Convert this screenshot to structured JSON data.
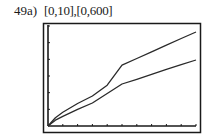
{
  "problem_label": "49a)",
  "window_label": "[0,10],[0,600]",
  "chart_data": {
    "type": "line",
    "title": "[0,10],[0,600]",
    "xlabel": "",
    "ylabel": "",
    "xlim": [
      0,
      10
    ],
    "ylim": [
      0,
      600
    ],
    "x_ticks": [
      0,
      1,
      2,
      3,
      4,
      5,
      6,
      7,
      8,
      9,
      10
    ],
    "y_ticks": [
      0,
      100,
      200,
      300,
      400,
      500,
      600
    ],
    "grid": false,
    "legend": null,
    "x": [
      0,
      0.5,
      1,
      2,
      3,
      4,
      5,
      6,
      7,
      8,
      9,
      10
    ],
    "series": [
      {
        "name": "upper curve",
        "values": [
          0,
          50,
          82,
          135,
          180,
          245,
          365,
          405,
          445,
          485,
          525,
          564
        ]
      },
      {
        "name": "lower curve",
        "values": [
          0,
          35,
          58,
          100,
          138,
          195,
          252,
          280,
          310,
          340,
          368,
          396
        ]
      }
    ],
    "colors": {
      "frame": "#1a1a1a",
      "line": "#2a2a2a",
      "background": "#ffffff"
    }
  }
}
